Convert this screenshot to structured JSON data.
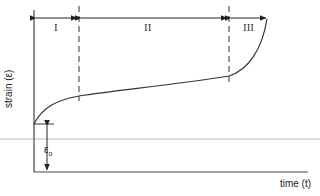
{
  "diagram": {
    "title": "",
    "type": "creep curve (strain vs time)",
    "y_axis_label": "strain (ε)",
    "x_axis_label": "time (t)",
    "initial_strain_label": "ε",
    "initial_strain_subscript": "o",
    "stages": [
      {
        "label": "I"
      },
      {
        "label": "II"
      },
      {
        "label": "III"
      }
    ],
    "colors": {
      "line": "#333333",
      "background": "#ffffff",
      "scan_line": "#d8d8d8"
    }
  }
}
